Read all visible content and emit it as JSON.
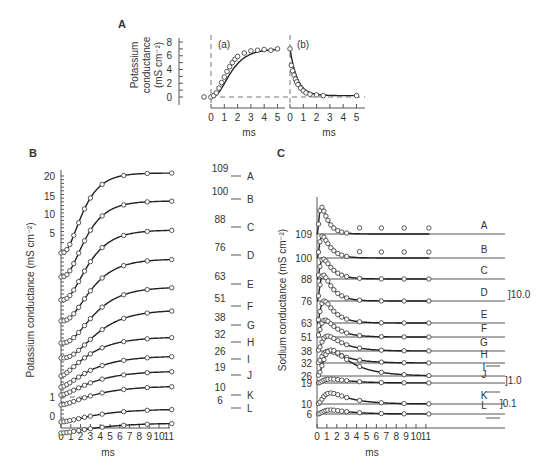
{
  "figure": {
    "panels": {
      "A": {
        "label": "A",
        "ylabel_lines": [
          "Potassium",
          "conductance",
          "(mS cm⁻²)"
        ],
        "yticks": [
          "0",
          "2",
          "4",
          "6",
          "8"
        ],
        "xticks": [
          "0",
          "1",
          "2",
          "3",
          "4",
          "5"
        ],
        "xlabel": "ms",
        "sub_a": "(a)",
        "sub_b": "(b)"
      },
      "B": {
        "label": "B",
        "ylabel": "Potassium conductance (mS cm⁻²)",
        "yticks": [
          "20",
          "15",
          "10",
          "5",
          "1",
          "0"
        ],
        "xticks": [
          "0",
          "1",
          "2",
          "3",
          "4",
          "5",
          "6",
          "7",
          "8",
          "9",
          "10",
          "11"
        ],
        "xlabel": "ms"
      },
      "C": {
        "label": "C",
        "ylabel": "Sodium conductance (mS cm⁻²)",
        "xticks": [
          "0",
          "1",
          "2",
          "3",
          "4",
          "5",
          "6",
          "7",
          "8",
          "9",
          "10",
          "11"
        ],
        "xlabel": "ms",
        "scale_bars": [
          "]10.0",
          "]1.0",
          "]0.1"
        ]
      }
    }
  },
  "chart_data": [
    {
      "type": "scatter",
      "title": "A",
      "subplots": [
        {
          "name": "(a) onset",
          "x": [
            0,
            0.2,
            0.4,
            0.6,
            0.8,
            1.0,
            1.2,
            1.4,
            1.6,
            1.8,
            2.0,
            2.5,
            3.0,
            3.5,
            4.0,
            4.5,
            5.0
          ],
          "y": [
            0,
            0.2,
            0.6,
            1.3,
            2.1,
            2.9,
            3.7,
            4.4,
            5.0,
            5.5,
            5.9,
            6.4,
            6.7,
            6.8,
            6.9,
            6.8,
            7.0
          ]
        },
        {
          "name": "(b) offset",
          "x": [
            0,
            0.1,
            0.2,
            0.3,
            0.4,
            0.5,
            0.6,
            0.8,
            1.0,
            1.2,
            1.5,
            2.0,
            2.5,
            5.0
          ],
          "y": [
            7.0,
            4.6,
            3.8,
            3.2,
            2.6,
            2.2,
            1.8,
            1.3,
            0.9,
            0.6,
            0.4,
            0.3,
            0.2,
            0.2
          ]
        }
      ],
      "xlabel": "ms",
      "ylabel": "Potassium conductance (mS cm-2)",
      "ylim": [
        0,
        8
      ],
      "xlim": [
        0,
        5
      ]
    },
    {
      "type": "line",
      "title": "B",
      "xlabel": "ms",
      "ylabel": "Potassium conductance (mS cm-2)",
      "xlim": [
        0,
        11
      ],
      "series": [
        {
          "name": "A",
          "depolarization_mV": 109,
          "steady": 20.5
        },
        {
          "name": "B",
          "depolarization_mV": 100,
          "steady": 18
        },
        {
          "name": "C",
          "depolarization_mV": 88,
          "steady": 15
        },
        {
          "name": "D",
          "depolarization_mV": 76,
          "steady": 12
        },
        {
          "name": "E",
          "depolarization_mV": 63,
          "steady": 9
        },
        {
          "name": "F",
          "depolarization_mV": 51,
          "steady": 6.5
        },
        {
          "name": "G",
          "depolarization_mV": 38,
          "steady": 4
        },
        {
          "name": "H",
          "depolarization_mV": 32,
          "steady": 3
        },
        {
          "name": "I",
          "depolarization_mV": 26,
          "steady": 2.2
        },
        {
          "name": "J",
          "depolarization_mV": 19,
          "steady": 1.4
        },
        {
          "name": "K",
          "depolarization_mV": 10,
          "steady": 0.5
        },
        {
          "name": "L",
          "depolarization_mV": 6,
          "steady": 0.25
        }
      ]
    },
    {
      "type": "line",
      "title": "C",
      "xlabel": "ms",
      "ylabel": "Sodium conductance (mS cm-2)",
      "xlim": [
        0,
        11
      ],
      "series": [
        {
          "name": "A",
          "depolarization_mV": 109,
          "peak_ms": 0.5
        },
        {
          "name": "B",
          "depolarization_mV": 100,
          "peak_ms": 0.6
        },
        {
          "name": "C",
          "depolarization_mV": 88,
          "peak_ms": 0.7
        },
        {
          "name": "D",
          "depolarization_mV": 76,
          "peak_ms": 0.7
        },
        {
          "name": "E",
          "depolarization_mV": 63,
          "peak_ms": 0.8
        },
        {
          "name": "F",
          "depolarization_mV": 51,
          "peak_ms": 0.9
        },
        {
          "name": "G",
          "depolarization_mV": 38,
          "peak_ms": 1.2
        },
        {
          "name": "H",
          "depolarization_mV": 32,
          "peak_ms": 1.3
        },
        {
          "name": "I",
          "depolarization_mV": 26,
          "peak_ms": 1.6
        },
        {
          "name": "J",
          "depolarization_mV": 19,
          "peak_ms": 1.5
        },
        {
          "name": "K",
          "depolarization_mV": 10,
          "peak_ms": 1.5
        },
        {
          "name": "L",
          "depolarization_mV": 6,
          "peak_ms": 1.5
        }
      ],
      "scale_bars": [
        "10.0",
        "1.0",
        "0.1"
      ]
    }
  ]
}
